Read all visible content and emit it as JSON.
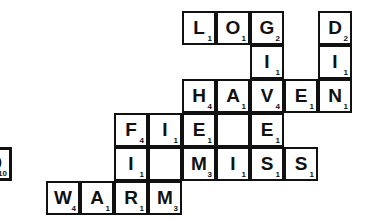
{
  "board": {
    "title": "Scrabble crossword board",
    "cell_size": 34,
    "origin_x": 12,
    "origin_y": 11,
    "ink_color": "#111111",
    "tile_color": "#ffffff",
    "background_color": "#ffffff",
    "words_across": [
      "LOG",
      "HAVEN",
      "FIE",
      "MISS",
      "WARM"
    ],
    "words_down": [
      "GIVE",
      "DIN",
      "FI",
      "EM",
      "IM",
      "ES"
    ],
    "tiles": [
      {
        "letter": "L",
        "value": "1",
        "row": 0,
        "col": 5,
        "loose": false,
        "blank": false
      },
      {
        "letter": "O",
        "value": "1",
        "row": 0,
        "col": 6,
        "loose": false,
        "blank": false
      },
      {
        "letter": "G",
        "value": "2",
        "row": 0,
        "col": 7,
        "loose": false,
        "blank": false
      },
      {
        "letter": "D",
        "value": "2",
        "row": 0,
        "col": 9,
        "loose": false,
        "blank": false
      },
      {
        "letter": "I",
        "value": "1",
        "row": 1,
        "col": 7,
        "loose": false,
        "blank": false
      },
      {
        "letter": "I",
        "value": "1",
        "row": 1,
        "col": 9,
        "loose": false,
        "blank": false
      },
      {
        "letter": "H",
        "value": "4",
        "row": 2,
        "col": 5,
        "loose": false,
        "blank": false
      },
      {
        "letter": "A",
        "value": "1",
        "row": 2,
        "col": 6,
        "loose": false,
        "blank": false
      },
      {
        "letter": "V",
        "value": "4",
        "row": 2,
        "col": 7,
        "loose": false,
        "blank": false
      },
      {
        "letter": "E",
        "value": "1",
        "row": 2,
        "col": 8,
        "loose": false,
        "blank": false
      },
      {
        "letter": "N",
        "value": "1",
        "row": 2,
        "col": 9,
        "loose": false,
        "blank": false
      },
      {
        "letter": "F",
        "value": "4",
        "row": 3,
        "col": 3,
        "loose": false,
        "blank": false
      },
      {
        "letter": "I",
        "value": "1",
        "row": 3,
        "col": 4,
        "loose": false,
        "blank": false
      },
      {
        "letter": "E",
        "value": "1",
        "row": 3,
        "col": 5,
        "loose": false,
        "blank": false
      },
      {
        "letter": "",
        "value": "",
        "row": 3,
        "col": 6,
        "loose": false,
        "blank": true
      },
      {
        "letter": "E",
        "value": "1",
        "row": 3,
        "col": 7,
        "loose": false,
        "blank": false
      },
      {
        "letter": "I",
        "value": "1",
        "row": 4,
        "col": 3,
        "loose": false,
        "blank": false
      },
      {
        "letter": "",
        "value": "",
        "row": 4,
        "col": 4,
        "loose": false,
        "blank": true
      },
      {
        "letter": "M",
        "value": "3",
        "row": 4,
        "col": 5,
        "loose": false,
        "blank": false
      },
      {
        "letter": "I",
        "value": "1",
        "row": 4,
        "col": 6,
        "loose": false,
        "blank": false
      },
      {
        "letter": "S",
        "value": "1",
        "row": 4,
        "col": 7,
        "loose": false,
        "blank": false
      },
      {
        "letter": "S",
        "value": "1",
        "row": 4,
        "col": 8,
        "loose": false,
        "blank": false
      },
      {
        "letter": "W",
        "value": "4",
        "row": 5,
        "col": 1,
        "loose": false,
        "blank": false
      },
      {
        "letter": "A",
        "value": "1",
        "row": 5,
        "col": 2,
        "loose": false,
        "blank": false
      },
      {
        "letter": "R",
        "value": "1",
        "row": 5,
        "col": 3,
        "loose": false,
        "blank": false
      },
      {
        "letter": "M",
        "value": "3",
        "row": 5,
        "col": 4,
        "loose": false,
        "blank": false
      },
      {
        "letter": "Q",
        "value": "10",
        "row": 4,
        "col": -1,
        "loose": true,
        "blank": false
      }
    ]
  }
}
